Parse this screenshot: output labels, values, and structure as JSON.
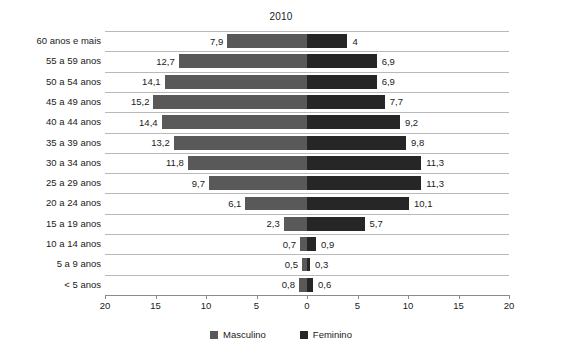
{
  "chart_data": {
    "type": "bar",
    "title": "2010",
    "subtype": "population-pyramid",
    "xlabel": "",
    "ylabel": "",
    "grid": true,
    "legend_position": "bottom",
    "axis_ticks": [
      20,
      15,
      10,
      5,
      0,
      5,
      10,
      15,
      20
    ],
    "xlim_left": [
      20,
      0
    ],
    "xlim_right": [
      0,
      20
    ],
    "categories": [
      "60 anos e mais",
      "55 a 59 anos",
      "50 a 54 anos",
      "45 a 49 anos",
      "40 a 44 anos",
      "35 a 39 anos",
      "30 a 34 anos",
      "25 a 29 anos",
      "20 a 24 anos",
      "15 a 19 anos",
      "10 a 14 anos",
      "5 a 9 anos",
      "< 5 anos"
    ],
    "series": [
      {
        "name": "Masculino",
        "color": "#595959",
        "side": "left",
        "values": [
          7.9,
          12.7,
          14.1,
          15.2,
          14.4,
          13.2,
          11.8,
          9.7,
          6.1,
          2.3,
          0.7,
          0.5,
          0.8
        ],
        "labels": [
          "7,9",
          "12,7",
          "14,1",
          "15,2",
          "14,4",
          "13,2",
          "11,8",
          "9,7",
          "6,1",
          "2,3",
          "0,7",
          "0,5",
          "0,8"
        ]
      },
      {
        "name": "Feminino",
        "color": "#262626",
        "side": "right",
        "values": [
          4,
          6.9,
          6.9,
          7.7,
          9.2,
          9.8,
          11.3,
          11.3,
          10.1,
          5.7,
          0.9,
          0.3,
          0.6
        ],
        "labels": [
          "4",
          "6,9",
          "6,9",
          "7,7",
          "9,2",
          "9,8",
          "11,3",
          "11,3",
          "10,1",
          "5,7",
          "0,9",
          "0,3",
          "0,6"
        ]
      }
    ],
    "legend": [
      {
        "label": "Masculino",
        "color": "#595959"
      },
      {
        "label": "Feminino",
        "color": "#262626"
      }
    ]
  }
}
